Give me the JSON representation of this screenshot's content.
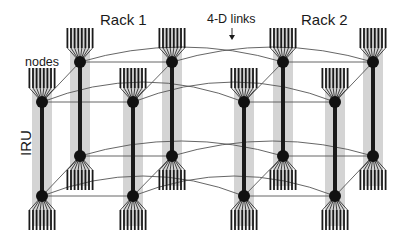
{
  "labels": {
    "rack1": "Rack 1",
    "rack2": "Rack 2",
    "links": "4-D links",
    "nodes": "nodes",
    "iru": "IRU"
  },
  "colors": {
    "backbone": "#1a1a1a",
    "shade": "#d4d4d4",
    "link": "#555555",
    "node": "#111111"
  },
  "columns": [
    {
      "id": "c1",
      "x": 42,
      "top": 102,
      "bottom": 196
    },
    {
      "id": "c2",
      "x": 80,
      "top": 62,
      "bottom": 156
    },
    {
      "id": "c3",
      "x": 133,
      "top": 102,
      "bottom": 196
    },
    {
      "id": "c4",
      "x": 172,
      "top": 62,
      "bottom": 156
    },
    {
      "id": "c5",
      "x": 244,
      "top": 102,
      "bottom": 196
    },
    {
      "id": "c6",
      "x": 283,
      "top": 62,
      "bottom": 156
    },
    {
      "id": "c7",
      "x": 335,
      "top": 102,
      "bottom": 196
    },
    {
      "id": "c8",
      "x": 373,
      "top": 62,
      "bottom": 156
    }
  ],
  "fan": {
    "prongs": 8,
    "spacing": 3.6,
    "length": 20,
    "gap": 14
  }
}
